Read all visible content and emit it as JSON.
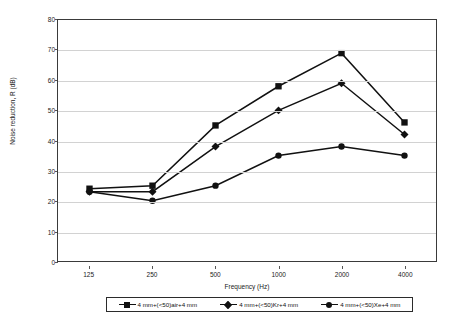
{
  "chart_data": {
    "type": "line",
    "title": "",
    "xlabel": "Frequency (Hz)",
    "ylabel": "Noise reduction, R (dB)",
    "categories": [
      "125",
      "250",
      "500",
      "1000",
      "2000",
      "4000"
    ],
    "ylim": [
      0,
      80
    ],
    "yticks": [
      "0",
      "10",
      "20",
      "30",
      "40",
      "50",
      "60",
      "70",
      "80"
    ],
    "grid": "horizontal",
    "legend_position": "bottom",
    "series": [
      {
        "name": "4 mm+(<50)air+4 mm",
        "marker": "square",
        "color": "#111111",
        "values": [
          24,
          25,
          45,
          58,
          69,
          46
        ]
      },
      {
        "name": "4 mm+(<50)Kr+4 mm",
        "marker": "diamond",
        "color": "#111111",
        "values": [
          23,
          23,
          38,
          50,
          59,
          42
        ]
      },
      {
        "name": "4 mm+(<50)Xe+4 mm",
        "marker": "circle",
        "color": "#111111",
        "values": [
          23,
          20,
          25,
          35,
          38,
          35
        ]
      }
    ]
  },
  "legend": {
    "items": [
      {
        "label": "4 mm+(<50)air+4 mm"
      },
      {
        "label": "4 mm+(<50)Kr+4 mm"
      },
      {
        "label": "4 mm+(<50)Xe+4 mm"
      }
    ]
  }
}
